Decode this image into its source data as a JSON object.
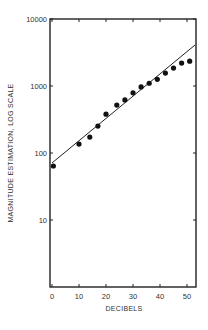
{
  "chart_data": {
    "type": "scatter",
    "title": "",
    "xlabel": "DECIBELS",
    "ylabel": "MAGNITUDE ESTIMATION, LOG SCALE",
    "xlim": [
      0,
      53
    ],
    "ylim": [
      1,
      10000
    ],
    "yscale": "log",
    "x_ticks": [
      0,
      10,
      20,
      30,
      40,
      50
    ],
    "x_tick_labels": [
      "0",
      "10",
      "20",
      "30",
      "40",
      "50"
    ],
    "y_ticks": [
      10,
      100,
      1000,
      10000
    ],
    "y_tick_labels": [
      "10",
      "100",
      "1000",
      "10000"
    ],
    "grid": false,
    "legend": null,
    "series": [
      {
        "name": "data",
        "kind": "points",
        "x": [
          0.5,
          10,
          14,
          17,
          20,
          24,
          27,
          30,
          33,
          36,
          39,
          42,
          45,
          48,
          51
        ],
        "y": [
          64,
          136,
          173,
          252,
          380,
          520,
          620,
          790,
          970,
          1100,
          1260,
          1560,
          1850,
          2200,
          2350
        ]
      },
      {
        "name": "fit",
        "kind": "line",
        "x": [
          0,
          53
        ],
        "y": [
          71,
          4100
        ]
      }
    ]
  }
}
